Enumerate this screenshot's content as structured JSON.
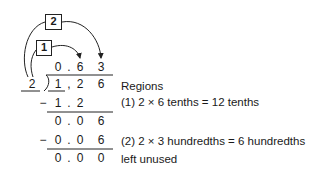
{
  "labels": {
    "step2": "2",
    "step1": "1"
  },
  "divisor": "2",
  "quotient": {
    "d0": "0",
    "dot": ".",
    "d1": "6",
    "d2": "3"
  },
  "dividend": {
    "d0": "1",
    "dot": ",",
    "d1": "2",
    "d2": "6"
  },
  "rows": [
    {
      "sign": "−",
      "d0": "1",
      "dot": ".",
      "d1": "2",
      "d2": ""
    },
    {
      "sign": "",
      "d0": "0",
      "dot": ".",
      "d1": "0",
      "d2": "6"
    },
    {
      "sign": "−",
      "d0": "0",
      "dot": ".",
      "d1": "0",
      "d2": "6"
    },
    {
      "sign": "",
      "d0": "0",
      "dot": ".",
      "d1": "0",
      "d2": "0"
    }
  ],
  "notes": {
    "heading": "Regions",
    "step1": "(1) 2 × 6 tenths = 12 tenths",
    "step2": "(2) 2 × 3 hundredths = 6 hundredths",
    "remainder": "left unused"
  }
}
